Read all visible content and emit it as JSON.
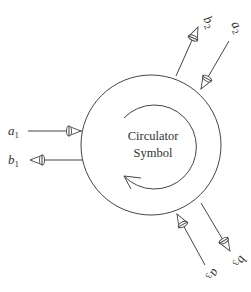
{
  "diagram": {
    "title_line1": "Circulator",
    "title_line2": "Symbol",
    "colors": {
      "stroke": "#444444",
      "text": "#333333",
      "background": "#ffffff"
    },
    "circulation_direction": "clockwise",
    "ports": [
      {
        "port": 1,
        "incident": {
          "label": "a",
          "subscript": "1",
          "direction": "into-circle"
        },
        "reflected": {
          "label": "b",
          "subscript": "1",
          "direction": "out-of-circle"
        }
      },
      {
        "port": 2,
        "incident": {
          "label": "a",
          "subscript": "2",
          "direction": "into-circle"
        },
        "reflected": {
          "label": "b",
          "subscript": "2",
          "direction": "out-of-circle"
        }
      },
      {
        "port": 3,
        "incident": {
          "label": "a",
          "subscript": "3",
          "direction": "into-circle"
        },
        "reflected": {
          "label": "b",
          "subscript": "3",
          "direction": "out-of-circle"
        }
      }
    ]
  }
}
